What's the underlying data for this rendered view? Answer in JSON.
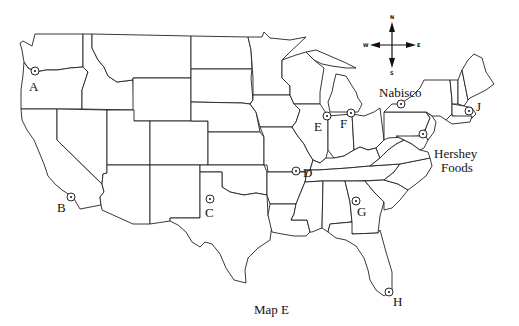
{
  "map": {
    "title": "Map E",
    "region": "Contiguous United States",
    "colors": {
      "outline": "#222222",
      "background": "#ffffff",
      "text": "#111111"
    },
    "compass": {
      "north": "N",
      "south": "S",
      "east": "E",
      "west": "W",
      "icon": "compass-rose-icon"
    },
    "markers": [
      {
        "id": "A",
        "label": "A",
        "x": 35,
        "y": 71,
        "label_x": 29,
        "label_y": 80,
        "location_hint": "Portland, Oregon"
      },
      {
        "id": "B",
        "label": "B",
        "x": 71,
        "y": 197,
        "label_x": 57,
        "label_y": 201,
        "location_hint": "Los Angeles, California"
      },
      {
        "id": "C",
        "label": "C",
        "x": 210,
        "y": 199,
        "label_x": 205,
        "label_y": 206,
        "location_hint": "West Texas"
      },
      {
        "id": "D",
        "label": "D",
        "x": 296,
        "y": 171,
        "label_x": 303,
        "label_y": 166,
        "location_hint": "Kansas City, Missouri"
      },
      {
        "id": "E",
        "label": "E",
        "x": 327,
        "y": 116,
        "label_x": 314,
        "label_y": 120,
        "location_hint": "Chicago, Illinois"
      },
      {
        "id": "F",
        "label": "F",
        "x": 351,
        "y": 113,
        "label_x": 340,
        "label_y": 117,
        "location_hint": "Northern Indiana"
      },
      {
        "id": "Nabisco",
        "label": "Nabisco",
        "x": 401,
        "y": 104,
        "label_x": 379,
        "label_y": 86,
        "location_hint": "Buffalo, New York"
      },
      {
        "id": "J",
        "label": "J",
        "x": 469,
        "y": 111,
        "label_x": 476,
        "label_y": 100,
        "location_hint": "Boston, Massachusetts"
      },
      {
        "id": "Hershey",
        "label_line1": "Hershey",
        "label_line2": "Foods",
        "x": 423,
        "y": 134,
        "label_x": 434,
        "label_y": 147,
        "location_hint": "Hershey, Pennsylvania"
      },
      {
        "id": "G",
        "label": "G",
        "x": 356,
        "y": 201,
        "label_x": 357,
        "label_y": 205,
        "location_hint": "Atlanta, Georgia"
      },
      {
        "id": "H",
        "label": "H",
        "x": 389,
        "y": 292,
        "label_x": 393,
        "label_y": 295,
        "location_hint": "Miami, Florida"
      }
    ]
  }
}
